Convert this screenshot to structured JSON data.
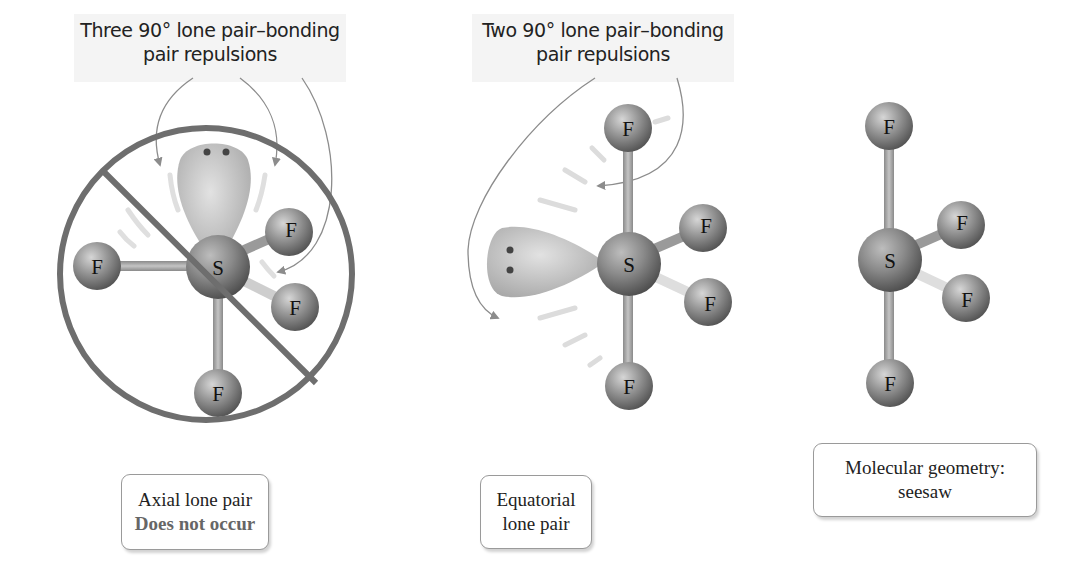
{
  "panels": [
    {
      "id": "axial",
      "caption": [
        "Three 90° lone pair–bonding",
        "pair repulsions"
      ],
      "label": [
        "Axial lone pair",
        "Does not occur"
      ],
      "central_atom": "S",
      "ligands": [
        "F",
        "F",
        "F",
        "F"
      ],
      "crossed_out": true
    },
    {
      "id": "equatorial",
      "caption": [
        "Two 90° lone pair–bonding",
        "pair repulsions"
      ],
      "label": [
        "Equatorial",
        "lone pair"
      ],
      "central_atom": "S",
      "ligands": [
        "F",
        "F",
        "F",
        "F"
      ],
      "crossed_out": false
    },
    {
      "id": "geometry",
      "label": [
        "Molecular geometry:",
        "seesaw"
      ],
      "central_atom": "S",
      "ligands": [
        "F",
        "F",
        "F",
        "F"
      ]
    }
  ],
  "colors": {
    "prohibit_ring": "#6e6e6e",
    "atom": "#8a8a8a",
    "lobe": "#c8c8c8",
    "arrow": "#8c8c8c",
    "caption_bg": "#f4f4f4"
  }
}
